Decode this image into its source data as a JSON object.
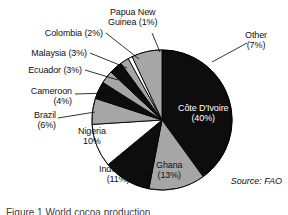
{
  "figure": {
    "source_note": "Source: FAO",
    "caption": "Figure 1  World cocoa production"
  },
  "colors": {
    "black": "#0d0d0d",
    "gray": "#a6a6a6",
    "white": "#ffffff",
    "outline": "#000000",
    "text": "#111111",
    "text_on_dark": "#ffffff"
  },
  "labels": {
    "cote_divoire": {
      "line1": "Côte D'Ivoire",
      "line2": "(40%)"
    },
    "ghana": {
      "line1": "Ghana",
      "line2": "(13%)"
    },
    "indonesia": {
      "line1": "Indonesia",
      "line2": "(11%)"
    },
    "nigeria": {
      "line1": "Nigeria",
      "line2": "10%"
    },
    "brazil": {
      "line1": "Brazil",
      "line2": "(6%)"
    },
    "cameroon": {
      "line1": "Cameroon",
      "line2": "(4%)"
    },
    "ecuador": {
      "line1": "Ecuador (3%)",
      "line2": ""
    },
    "malaysia": {
      "line1": "Malaysia (3%)",
      "line2": ""
    },
    "colombia": {
      "line1": "Colombia (2%)",
      "line2": ""
    },
    "papua_new_guinea": {
      "line1": "Papua New",
      "line2": "Guinea (1%)"
    },
    "other": {
      "line1": "Other",
      "line2": "(7%)"
    }
  },
  "chart_data": {
    "type": "pie",
    "title": "",
    "subtitle": "",
    "xlabel": "",
    "ylabel": "",
    "legend": "none",
    "grid": false,
    "start_angle_deg": 0,
    "direction": "clockwise",
    "units": "percent of world cocoa production",
    "source": "FAO",
    "total": 100,
    "categories": [
      "Côte D'Ivoire",
      "Ghana",
      "Indonesia",
      "Nigeria",
      "Brazil",
      "Cameroon",
      "Ecuador",
      "Malaysia",
      "Colombia",
      "Papua New Guinea",
      "Other"
    ],
    "values": [
      40,
      13,
      11,
      10,
      6,
      4,
      3,
      3,
      2,
      1,
      7
    ],
    "slice_colors": [
      "#0d0d0d",
      "#a6a6a6",
      "#0d0d0d",
      "#ffffff",
      "#a6a6a6",
      "#0d0d0d",
      "#a6a6a6",
      "#0d0d0d",
      "#a6a6a6",
      "#ffffff",
      "#a6a6a6"
    ],
    "slice_label_text": [
      "Côte D'Ivoire (40%)",
      "Ghana (13%)",
      "Indonesia (11%)",
      "Nigeria 10%",
      "Brazil (6%)",
      "Cameroon (4%)",
      "Ecuador (3%)",
      "Malaysia (3%)",
      "Colombia (2%)",
      "Papua New Guinea (1%)",
      "Other (7%)"
    ]
  },
  "geometry": {
    "center_x": 162,
    "center_y": 120,
    "radius": 70
  }
}
